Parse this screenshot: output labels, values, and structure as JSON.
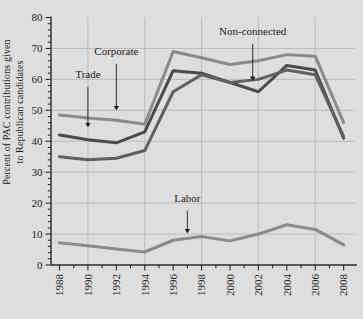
{
  "chart_data": {
    "type": "line",
    "title": "",
    "xlabel": "",
    "ylabel": "Percent of PAC contributions given\nto Republican candidates",
    "x": [
      1988,
      1990,
      1992,
      1994,
      1996,
      1998,
      2000,
      2002,
      2004,
      2006,
      2008
    ],
    "xlim": [
      1987.4,
      2008.8
    ],
    "ylim": [
      0,
      80
    ],
    "xticks": [
      "1988",
      "1990",
      "1992",
      "1994",
      "1996",
      "1998",
      "2000",
      "2002",
      "2004",
      "2006",
      "2008"
    ],
    "yticks": [
      "0",
      "10",
      "20",
      "30",
      "40",
      "50",
      "60",
      "70",
      "80"
    ],
    "ytick_step": 10,
    "yminor_step": 2,
    "grid": "horizontal-and-vertical-light",
    "legend_position": "inline-annotations",
    "background_color": "#dedede",
    "plot_background_color": "#dedede",
    "grid_color": "#b8b8b8",
    "axis_color": "#2a2a2a",
    "series": [
      {
        "name": "Non-connected",
        "color": "#8a8a8a",
        "values": [
          48.5,
          47.5,
          46.8,
          45.5,
          69.0,
          67.0,
          64.8,
          66.0,
          68.0,
          67.5,
          46.0
        ]
      },
      {
        "name": "Corporate",
        "color": "#4a4a4a",
        "values": [
          42.0,
          40.5,
          39.5,
          43.0,
          62.8,
          62.0,
          59.0,
          56.0,
          64.5,
          63.0,
          41.0
        ]
      },
      {
        "name": "Trade",
        "color": "#606060",
        "values": [
          35.0,
          34.0,
          34.5,
          37.0,
          56.0,
          61.5,
          59.0,
          60.0,
          63.0,
          61.5,
          41.5
        ]
      },
      {
        "name": "Labor",
        "color": "#8a8a8a",
        "values": [
          7.2,
          6.2,
          5.2,
          4.2,
          8.0,
          9.2,
          7.8,
          10.0,
          13.0,
          11.5,
          6.5
        ]
      }
    ],
    "annotations": [
      {
        "label": "Trade",
        "label_x": 1990.0,
        "label_y": 60.5,
        "arrow_x": 1990.0,
        "arrow_from_y": 57.5,
        "arrow_to_y": 44.5
      },
      {
        "label": "Corporate",
        "label_x": 1992.0,
        "label_y": 68.0,
        "arrow_x": 1992.0,
        "arrow_from_y": 65.0,
        "arrow_to_y": 50.0
      },
      {
        "label": "Non-connected",
        "label_x": 2001.6,
        "label_y": 74.5,
        "arrow_x": 2001.6,
        "arrow_from_y": 71.5,
        "arrow_to_y": 59.5
      },
      {
        "label": "Labor",
        "label_x": 1997.0,
        "label_y": 20.5,
        "arrow_x": 1997.0,
        "arrow_from_y": 17.6,
        "arrow_to_y": 10.2
      }
    ]
  }
}
